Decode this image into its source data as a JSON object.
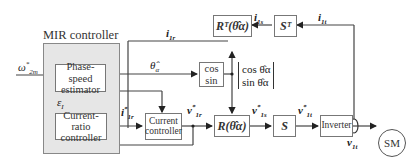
{
  "mir_controller": {
    "title": "MIR controller",
    "phase_speed_estimator": [
      "Phase-speed",
      "estimator"
    ],
    "current_ratio_controller": [
      "Current-ratio",
      "controller"
    ]
  },
  "blocks": {
    "current_controller": [
      "Current",
      "controller"
    ],
    "cos_sin": [
      "cos",
      "sin"
    ],
    "rotation": "R(θ̂α)",
    "rotation_transpose": "Rᵀ(θ̂α)",
    "s_matrix": "S",
    "s_transpose": "Sᵀ",
    "inverter": "Inverter",
    "motor": "SM"
  },
  "signals": {
    "speed_ref": "ω*2m",
    "theta_hat": "θ̂α",
    "epsilon": "ε_I",
    "i1r_ref": "i*1r",
    "v1r_ref": "v*1r",
    "v1s_ref": "v*1s",
    "v1t_ref": "v*1t",
    "i1r": "i1r",
    "i1s": "i1s",
    "i1t": "i1t",
    "v1t": "v1t",
    "cos_sin_vector": [
      "cos θ̂α",
      "sin θ̂α"
    ]
  }
}
